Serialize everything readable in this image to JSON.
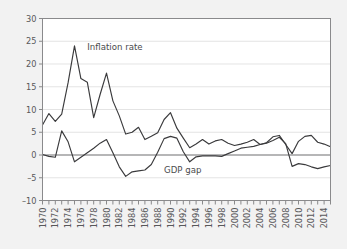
{
  "chart_data": {
    "type": "line",
    "title": "",
    "subtitle": "",
    "xlabel": "",
    "ylabel": "",
    "xlim": [
      1970,
      2015
    ],
    "ylim": [
      -10,
      30
    ],
    "grid": true,
    "legend_position": "inline-annotation",
    "y_ticks": [
      30,
      25,
      20,
      15,
      10,
      5,
      0,
      -5,
      -10
    ],
    "y_tick_labels": [
      "30",
      "25",
      "20",
      "15",
      "10",
      "5",
      "0",
      "-5",
      "-10"
    ],
    "x_ticks": [
      1970,
      1971,
      1972,
      1973,
      1974,
      1975,
      1976,
      1977,
      1978,
      1979,
      1980,
      1981,
      1982,
      1983,
      1984,
      1985,
      1986,
      1987,
      1988,
      1989,
      1990,
      1991,
      1992,
      1993,
      1994,
      1995,
      1996,
      1997,
      1998,
      1999,
      2000,
      2001,
      2002,
      2003,
      2004,
      2005,
      2006,
      2007,
      2008,
      2009,
      2010,
      2011,
      2012,
      2013,
      2014,
      2015
    ],
    "x_tick_labels": [
      "1970",
      "1972",
      "1974",
      "1976",
      "1978",
      "1980",
      "1982",
      "1984",
      "1986",
      "1988",
      "1990",
      "1992",
      "1994",
      "1996",
      "1998",
      "2000",
      "2002",
      "2004",
      "2006",
      "2008",
      "2010",
      "2012",
      "2014"
    ],
    "x_label_years": [
      1970,
      1972,
      1974,
      1976,
      1978,
      1980,
      1982,
      1984,
      1986,
      1988,
      1990,
      1992,
      1994,
      1996,
      1998,
      2000,
      2002,
      2004,
      2006,
      2008,
      2010,
      2012,
      2014
    ],
    "zero_reference_line": 0,
    "x": [
      1970,
      1971,
      1972,
      1973,
      1974,
      1975,
      1976,
      1977,
      1978,
      1979,
      1980,
      1981,
      1982,
      1983,
      1984,
      1985,
      1986,
      1987,
      1988,
      1989,
      1990,
      1991,
      1992,
      1993,
      1994,
      1995,
      1996,
      1997,
      1998,
      1999,
      2000,
      2001,
      2002,
      2003,
      2004,
      2005,
      2006,
      2007,
      2008,
      2009,
      2010,
      2011,
      2012,
      2013,
      2014,
      2015
    ],
    "series": [
      {
        "name": "Inflation rate",
        "color": "#3a3a3c",
        "label_x": 1977.0,
        "label_y": 23.0,
        "values": [
          6.6,
          9.1,
          7.4,
          9.0,
          15.9,
          24.0,
          16.8,
          16.0,
          8.2,
          13.3,
          18.0,
          11.9,
          8.6,
          4.6,
          5.0,
          6.1,
          3.4,
          4.1,
          4.9,
          7.8,
          9.3,
          5.9,
          3.7,
          1.6,
          2.4,
          3.4,
          2.4,
          3.1,
          3.4,
          2.6,
          2.1,
          2.4,
          2.8,
          3.4,
          2.3,
          2.7,
          4.0,
          4.3,
          2.3,
          0.3,
          3.0,
          4.1,
          4.3,
          2.8,
          2.4,
          1.8
        ]
      },
      {
        "name": "GDP gap",
        "color": "#3a3a3c",
        "label_x": 1989.0,
        "label_y": -4.0,
        "values": [
          0.1,
          -0.3,
          -0.5,
          5.3,
          2.9,
          -1.5,
          -0.5,
          0.5,
          1.5,
          2.6,
          3.4,
          0.5,
          -2.6,
          -4.7,
          -3.7,
          -3.5,
          -3.3,
          -2.1,
          0.6,
          3.6,
          4.1,
          3.7,
          0.7,
          -1.5,
          -0.4,
          -0.2,
          -0.2,
          -0.2,
          -0.3,
          0.3,
          0.9,
          1.5,
          1.7,
          1.9,
          2.3,
          2.6,
          3.2,
          3.9,
          2.5,
          -2.5,
          -1.9,
          -2.1,
          -2.6,
          -3.0,
          -2.6,
          -2.3
        ]
      }
    ]
  },
  "figure": {
    "background_color": "#f2f2f2",
    "plot_background_color": "#ffffff",
    "grid_color": "#d8d8d8",
    "frame_color": "#8a8a8c",
    "text_color": "#58585a"
  }
}
